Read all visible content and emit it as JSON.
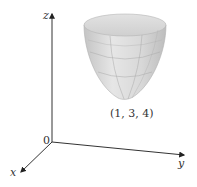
{
  "figure": {
    "type": "3d-surface",
    "surface": "elliptic paraboloid opening upward",
    "vertex_label": "(1, 3, 4)",
    "vertex": [
      1,
      3,
      4
    ]
  },
  "axes": {
    "x_label": "x",
    "y_label": "y",
    "z_label": "z",
    "origin_label": "0"
  },
  "colors": {
    "axis": "#333333",
    "surface_fill": "#d6d6d6",
    "surface_highlight": "#ededed",
    "mesh": "#a8a8a8"
  }
}
